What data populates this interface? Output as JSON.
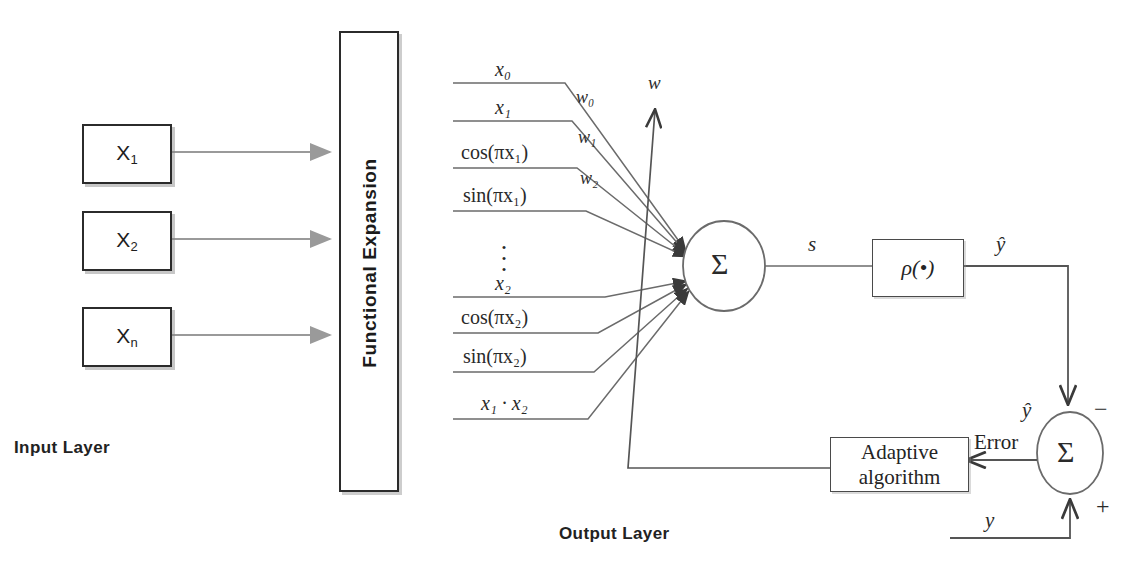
{
  "figure": {
    "type": "block-diagram"
  },
  "input_layer": {
    "label": "Input Layer",
    "nodes": [
      {
        "name": "X",
        "subscript": "1"
      },
      {
        "name": "X",
        "subscript": "2"
      },
      {
        "name": "X",
        "subscript": "n"
      }
    ]
  },
  "functional_expansion": {
    "label": "Functional Expansion"
  },
  "expansion_terms": [
    {
      "text": "x₀",
      "tex": "x_0"
    },
    {
      "text": "x₁",
      "tex": "x_1"
    },
    {
      "text": "cos(πx₁)",
      "tex": "cos(\\pi x_1)"
    },
    {
      "text": "sin(πx₁)",
      "tex": "sin(\\pi x_1)"
    },
    {
      "text": "⋮",
      "tex": "\\vdots"
    },
    {
      "text": "x₂",
      "tex": "x_2"
    },
    {
      "text": "cos(πx₂)",
      "tex": "cos(\\pi x_2)"
    },
    {
      "text": "sin(πx₂)",
      "tex": "sin(\\pi x_2)"
    },
    {
      "text": "x₁ · x₂",
      "tex": "x_1 \\cdot x_2"
    }
  ],
  "weights": {
    "w0": "w₀",
    "w1": "w₁",
    "w2": "w₂",
    "w_update": "w"
  },
  "summing_node": {
    "symbol": "Σ"
  },
  "sum_output": {
    "label": "s"
  },
  "activation": {
    "label": "ρ(•)"
  },
  "prediction": {
    "label": "ŷ",
    "label_at_error_node": "ŷ"
  },
  "error_node": {
    "symbol": "Σ",
    "minus_sign": "−",
    "plus_sign": "+",
    "error_label": "Error",
    "target_label": "y"
  },
  "adaptive_block": {
    "line1": "Adaptive",
    "line2": "algorithm"
  },
  "output_layer": {
    "label": "Output Layer"
  },
  "colors": {
    "stroke_dark": "#2b2b2b",
    "stroke_mid": "#4a4a4a",
    "stroke_light": "#9a9a9a",
    "text": "#1b1b1b",
    "background": "#ffffff"
  }
}
